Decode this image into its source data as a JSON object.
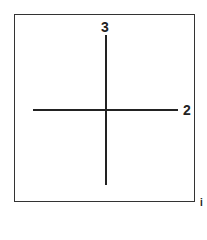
{
  "diagram": {
    "type": "axis-cross",
    "axes": [
      {
        "label": "3",
        "direction": "vertical"
      },
      {
        "label": "2",
        "direction": "horizontal"
      }
    ],
    "corner_mark": "i"
  }
}
